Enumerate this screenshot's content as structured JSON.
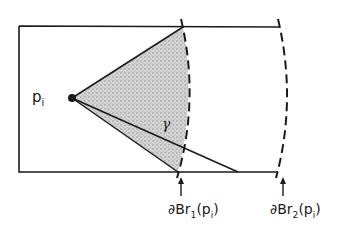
{
  "figure": {
    "point_label": {
      "main": "p",
      "sub": "i"
    },
    "path_label": "γ",
    "boundary_1": {
      "prefix": "∂B",
      "r": "r",
      "r_sub": "1",
      "arg_open": "(p",
      "arg_sub": "i",
      "arg_close": ")"
    },
    "boundary_2": {
      "prefix": "∂B",
      "r": "r",
      "r_sub": "2",
      "arg_open": "(p",
      "arg_sub": "i",
      "arg_close": ")"
    },
    "colors": {
      "stroke": "#1a1a1a",
      "shade": "#b8b8b8",
      "background": "#ffffff"
    }
  }
}
